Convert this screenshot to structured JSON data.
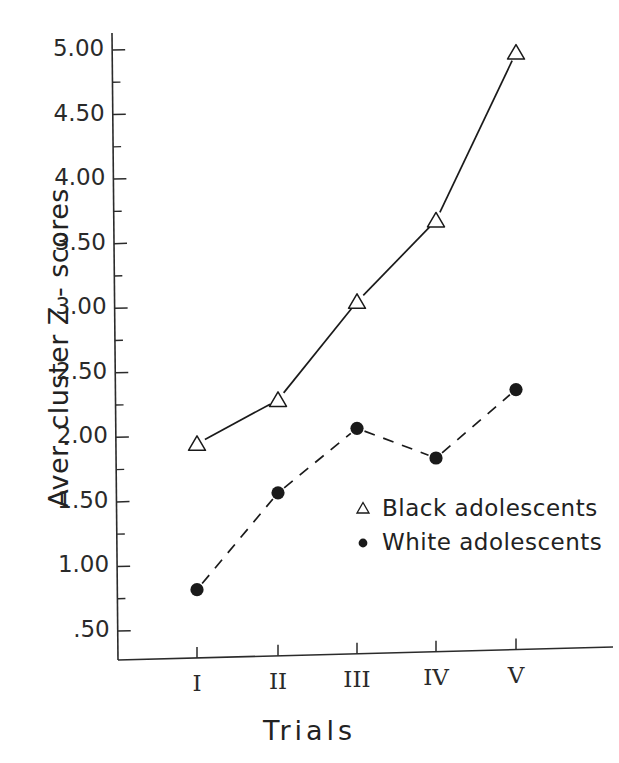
{
  "chart_data": {
    "type": "line",
    "title": "",
    "xlabel": "Trials",
    "ylabel": "Aver. cluster Z - scores",
    "categories": [
      "I",
      "II",
      "III",
      "IV",
      "V"
    ],
    "ylim": [
      0.25,
      5.25
    ],
    "ytick_labels": [
      "5.00",
      "4.50",
      "4.00",
      "3.50",
      "3.00",
      "2.50",
      "2.00",
      "1.50",
      "1.00",
      ".50"
    ],
    "ytick_values": [
      5.0,
      4.5,
      4.0,
      3.5,
      3.0,
      2.5,
      2.0,
      1.5,
      1.0,
      0.5
    ],
    "minor_ticks": [
      4.75,
      4.25,
      3.75,
      3.25,
      2.75,
      2.25,
      1.75,
      1.25,
      0.75
    ],
    "grid": false,
    "legend_position": "center-right",
    "series": [
      {
        "name": "Black adolescents",
        "marker": "open-triangle",
        "linestyle": "solid",
        "color": "#1a1a1a",
        "values": [
          1.95,
          2.29,
          3.05,
          3.68,
          4.98
        ]
      },
      {
        "name": "White adolescents",
        "marker": "filled-circle",
        "linestyle": "dashed",
        "color": "#1a1a1a",
        "values": [
          0.82,
          1.57,
          2.07,
          1.84,
          2.37
        ]
      }
    ]
  },
  "legend": {
    "items": [
      {
        "label": "Black adolescents",
        "marker": "open-triangle"
      },
      {
        "label": "White adolescents",
        "marker": "filled-circle"
      }
    ]
  },
  "axis": {
    "x_title": "Trials",
    "y_title": "Aver. cluster Z - scores"
  }
}
